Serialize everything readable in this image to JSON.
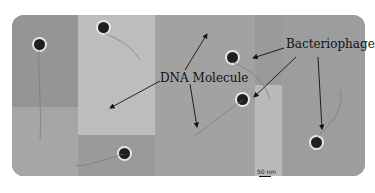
{
  "figure": {
    "labels": {
      "dna": "DNA Molecule",
      "phage": "Bacteriophage"
    },
    "scale_bar": {
      "text": "50 nm"
    }
  }
}
